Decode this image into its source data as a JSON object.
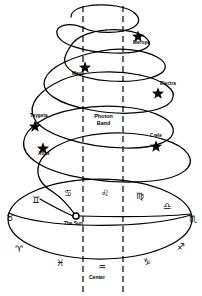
{
  "diagram": {
    "type": "astronomical-spiral-helix",
    "colors": {
      "stroke": "#000000",
      "background": "#ffffff"
    },
    "band": {
      "label_line1": "Photon",
      "label_line2": "Band",
      "left_line_x": 83,
      "right_line_x": 123,
      "style": "dashed-vertical"
    },
    "sun": {
      "label": "The Sun",
      "marker": "circle-open",
      "x": 76,
      "y": 216
    },
    "center": {
      "label": "Center",
      "symbol": "♒",
      "symbol_name": "aquarius"
    },
    "stars": [
      {
        "name": "Merope",
        "x": 138,
        "y": 36,
        "label_dx": -2,
        "label_dy": 5
      },
      {
        "name": "Maya",
        "x": 85,
        "y": 67,
        "label_dx": -10,
        "label_dy": 6
      },
      {
        "name": "Electra",
        "x": 158,
        "y": 93,
        "label_dx": 3,
        "label_dy": -4
      },
      {
        "name": "Taygeta",
        "x": 35,
        "y": 126,
        "label_dx": -1,
        "label_dy": -6
      },
      {
        "name": "Cœle",
        "x": 156,
        "y": 146,
        "label_dx": -2,
        "label_dy": -6
      },
      {
        "name": "Atlas",
        "x": 43,
        "y": 148,
        "label_dx": -2,
        "label_dy": 7
      }
    ],
    "zodiac": [
      {
        "name": "cancer",
        "symbol": "♋",
        "x": 64,
        "y": 189
      },
      {
        "name": "leo",
        "symbol": "♌",
        "x": 101,
        "y": 189
      },
      {
        "name": "virgo",
        "symbol": "♍",
        "x": 136,
        "y": 192
      },
      {
        "name": "libra",
        "symbol": "♎",
        "x": 163,
        "y": 202
      },
      {
        "name": "scorpio",
        "symbol": "♏",
        "x": 190,
        "y": 215
      },
      {
        "name": "sagittarius",
        "symbol": "♐",
        "x": 178,
        "y": 243
      },
      {
        "name": "capricorn",
        "symbol": "♑",
        "x": 143,
        "y": 258
      },
      {
        "name": "aquarius",
        "symbol": "♒",
        "x": 100,
        "y": 262
      },
      {
        "name": "pisces",
        "symbol": "♓",
        "x": 57,
        "y": 259
      },
      {
        "name": "aries",
        "symbol": "♈",
        "x": 17,
        "y": 245
      },
      {
        "name": "taurus",
        "symbol": "♉",
        "x": 8,
        "y": 215
      },
      {
        "name": "gemini",
        "symbol": "♊",
        "x": 33,
        "y": 197
      }
    ]
  }
}
